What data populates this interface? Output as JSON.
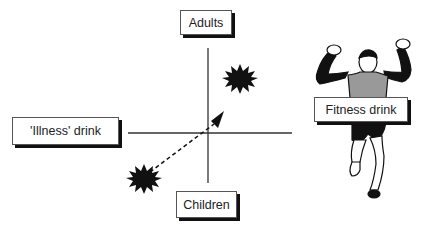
{
  "diagram": {
    "type": "positioning-map",
    "axes": {
      "top": "Adults",
      "bottom": "Children",
      "left": "'Illness' drink",
      "right": "Fitness drink"
    },
    "points": [
      {
        "name": "current-position",
        "quadrant": "bottom-left",
        "marker": "starburst"
      },
      {
        "name": "target-position",
        "quadrant": "top-right",
        "marker": "starburst"
      }
    ],
    "arrow": {
      "from": "current-position",
      "to": "target-position",
      "style": "dashed"
    },
    "illustration": "runner-celebrating",
    "colors": {
      "ink": "#111111",
      "box_border": "#555555",
      "shadow": "#111111",
      "background": "#ffffff"
    }
  }
}
